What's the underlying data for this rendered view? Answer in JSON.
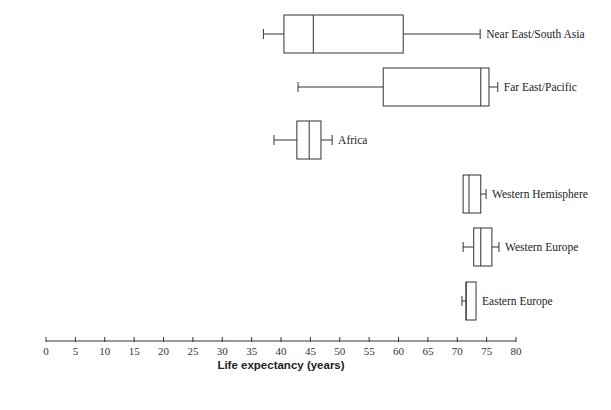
{
  "chart_data": {
    "type": "boxplot",
    "title": "",
    "xlabel": "Life expectancy (years)",
    "ylabel": "",
    "xlim": [
      0,
      80
    ],
    "x_ticks": [
      0,
      5,
      10,
      15,
      20,
      25,
      30,
      35,
      40,
      45,
      50,
      55,
      60,
      65,
      70,
      75,
      80
    ],
    "grid": false,
    "orientation": "horizontal",
    "series": [
      {
        "name": "Near East/South Asia",
        "min": 37,
        "q1": 40.5,
        "median": 45.5,
        "q3": 60.8,
        "max": 73.9
      },
      {
        "name": "Far East/Pacific",
        "min": 42.9,
        "q1": 57.4,
        "median": 74,
        "q3": 75.4,
        "max": 76.9
      },
      {
        "name": "Africa",
        "min": 38.8,
        "q1": 42.7,
        "median": 44.8,
        "q3": 46.8,
        "max": 48.7
      },
      {
        "name": "Western Hemisphere",
        "min": 71,
        "q1": 71,
        "median": 72,
        "q3": 74,
        "max": 74.9
      },
      {
        "name": "Western Europe",
        "min": 71,
        "q1": 72.8,
        "median": 74,
        "q3": 75.9,
        "max": 77.1
      },
      {
        "name": "Eastern Europe",
        "min": 70.8,
        "q1": 71.5,
        "median": 71.5,
        "q3": 73.2,
        "max": 73.2
      }
    ]
  },
  "layout": {
    "axis_x0": 46,
    "axis_x1": 516,
    "axis_y": 341,
    "rows_y": [
      34,
      87,
      140,
      194,
      247,
      301
    ],
    "box_half_height": 19
  }
}
